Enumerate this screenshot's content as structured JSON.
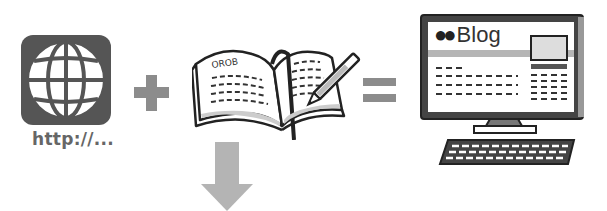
{
  "diagram": {
    "title": "",
    "elements": [
      {
        "id": "web-address",
        "label": "http://...",
        "icon": "globe-icon"
      },
      {
        "id": "plus",
        "symbol": "+",
        "icon": "plus-icon"
      },
      {
        "id": "notebook",
        "label": "OROB",
        "icon": "notebook-pen-icon"
      },
      {
        "id": "equals",
        "symbol": "=",
        "icon": "equals-icon"
      },
      {
        "id": "blog-computer",
        "label": "●●Blog",
        "icon": "computer-icon"
      },
      {
        "id": "down-arrow",
        "icon": "arrow-down-icon"
      }
    ],
    "relations": [
      {
        "from": "web-address",
        "op": "+",
        "to": "notebook"
      },
      {
        "from": "notebook",
        "op": "=",
        "to": "blog-computer"
      },
      {
        "from": "notebook",
        "op": "arrow-down",
        "to": ""
      }
    ]
  },
  "globe": {
    "caption": "http://..."
  },
  "notebook": {
    "page_heading": "OROB"
  },
  "computer": {
    "blog_dots": "●●",
    "blog_word": "Blog"
  },
  "colors": {
    "icon_dark": "#555555",
    "operator_gray": "#8c8c8c",
    "arrow_gray": "#b4b4b4",
    "outline": "#222222",
    "screen_fill": "#ffffff"
  }
}
